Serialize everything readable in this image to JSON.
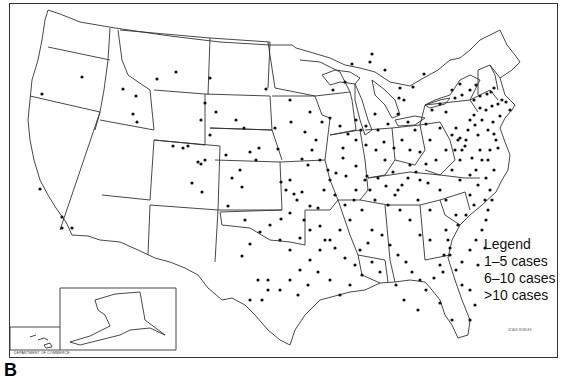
{
  "figure": {
    "panel_label": "B",
    "colors": {
      "background": "#ffffff",
      "lines": "#333333",
      "dots": "#111111"
    }
  },
  "legend": {
    "title": "Legend",
    "items": [
      {
        "label": "1–5 cases"
      },
      {
        "label": "6–10 cases"
      },
      {
        "label": ">10 cases"
      }
    ]
  },
  "insets": [
    {
      "name": "Alaska",
      "position": "bottom-left"
    },
    {
      "name": "Hawaii",
      "position": "bottom-left"
    }
  ],
  "footer": {
    "credit": "DEPARTMENT OF COMMERCE",
    "scale_label": "SCALE IN MILES"
  },
  "dots": [
    [
      42,
      94
    ],
    [
      82,
      77
    ],
    [
      136,
      96
    ],
    [
      157,
      79
    ],
    [
      176,
      72
    ],
    [
      123,
      89
    ],
    [
      133,
      114
    ],
    [
      137,
      122
    ],
    [
      173,
      146
    ],
    [
      183,
      148
    ],
    [
      188,
      146
    ],
    [
      198,
      162
    ],
    [
      201,
      164
    ],
    [
      205,
      160
    ],
    [
      205,
      103
    ],
    [
      201,
      120
    ],
    [
      266,
      89
    ],
    [
      302,
      159
    ],
    [
      242,
      187
    ],
    [
      202,
      192
    ],
    [
      192,
      183
    ],
    [
      228,
      206
    ],
    [
      245,
      220
    ],
    [
      40,
      189
    ],
    [
      62,
      217
    ],
    [
      72,
      228
    ],
    [
      62,
      228
    ],
    [
      275,
      128
    ],
    [
      281,
      182
    ],
    [
      291,
      122
    ],
    [
      305,
      132
    ],
    [
      308,
      165
    ],
    [
      278,
      149
    ],
    [
      259,
      148
    ],
    [
      286,
      190
    ],
    [
      294,
      194
    ],
    [
      290,
      213
    ],
    [
      281,
      219
    ],
    [
      297,
      200
    ],
    [
      290,
      180
    ],
    [
      302,
      192
    ],
    [
      310,
      206
    ],
    [
      318,
      208
    ],
    [
      304,
      220
    ],
    [
      336,
      173
    ],
    [
      343,
      148
    ],
    [
      343,
      158
    ],
    [
      346,
      176
    ],
    [
      356,
      166
    ],
    [
      354,
      200
    ],
    [
      367,
      176
    ],
    [
      370,
      190
    ],
    [
      385,
      160
    ],
    [
      393,
      172
    ],
    [
      398,
      190
    ],
    [
      410,
      165
    ],
    [
      420,
      180
    ],
    [
      418,
      200
    ],
    [
      428,
      183
    ],
    [
      430,
      210
    ],
    [
      440,
      190
    ],
    [
      446,
      200
    ],
    [
      446,
      230
    ],
    [
      456,
      215
    ],
    [
      460,
      180
    ],
    [
      452,
      170
    ],
    [
      460,
      160
    ],
    [
      462,
      150
    ],
    [
      466,
      140
    ],
    [
      468,
      130
    ],
    [
      470,
      120
    ],
    [
      474,
      115
    ],
    [
      475,
      125
    ],
    [
      478,
      135
    ],
    [
      480,
      150
    ],
    [
      482,
      160
    ],
    [
      470,
      195
    ],
    [
      474,
      205
    ],
    [
      466,
      215
    ],
    [
      458,
      225
    ],
    [
      448,
      240
    ],
    [
      430,
      240
    ],
    [
      420,
      235
    ],
    [
      410,
      220
    ],
    [
      400,
      210
    ],
    [
      388,
      205
    ],
    [
      375,
      200
    ],
    [
      362,
      210
    ],
    [
      350,
      220
    ],
    [
      340,
      230
    ],
    [
      330,
      240
    ],
    [
      320,
      250
    ],
    [
      310,
      260
    ],
    [
      300,
      270
    ],
    [
      290,
      280
    ],
    [
      280,
      290
    ],
    [
      268,
      290
    ],
    [
      258,
      280
    ],
    [
      250,
      300
    ],
    [
      262,
      300
    ],
    [
      268,
      280
    ],
    [
      242,
      256
    ],
    [
      250,
      244
    ],
    [
      260,
      232
    ],
    [
      270,
      225
    ],
    [
      280,
      240
    ],
    [
      290,
      250
    ],
    [
      300,
      238
    ],
    [
      310,
      230
    ],
    [
      320,
      226
    ],
    [
      325,
      240
    ],
    [
      335,
      248
    ],
    [
      345,
      258
    ],
    [
      355,
      265
    ],
    [
      360,
      250
    ],
    [
      368,
      243
    ],
    [
      372,
      230
    ],
    [
      382,
      235
    ],
    [
      390,
      245
    ],
    [
      398,
      255
    ],
    [
      406,
      262
    ],
    [
      412,
      272
    ],
    [
      420,
      280
    ],
    [
      426,
      290
    ],
    [
      434,
      278
    ],
    [
      440,
      265
    ],
    [
      444,
      255
    ],
    [
      450,
      248
    ],
    [
      462,
      262
    ],
    [
      470,
      250
    ],
    [
      476,
      240
    ],
    [
      482,
      230
    ],
    [
      486,
      220
    ],
    [
      488,
      210
    ],
    [
      485,
      200
    ],
    [
      478,
      185
    ],
    [
      470,
      175
    ],
    [
      455,
      150
    ],
    [
      458,
      140
    ],
    [
      460,
      138
    ],
    [
      465,
      146
    ],
    [
      472,
      158
    ],
    [
      476,
      170
    ],
    [
      486,
      178
    ],
    [
      490,
      190
    ],
    [
      492,
      200
    ],
    [
      494,
      170
    ],
    [
      488,
      160
    ],
    [
      490,
      150
    ],
    [
      496,
      140
    ],
    [
      488,
      130
    ],
    [
      482,
      120
    ],
    [
      486,
      110
    ],
    [
      492,
      106
    ],
    [
      498,
      104
    ],
    [
      502,
      100
    ],
    [
      506,
      102
    ],
    [
      510,
      110
    ],
    [
      500,
      116
    ],
    [
      493,
      122
    ],
    [
      494,
      134
    ],
    [
      498,
      148
    ],
    [
      480,
      108
    ],
    [
      474,
      100
    ],
    [
      470,
      90
    ],
    [
      456,
      128
    ],
    [
      440,
      128
    ],
    [
      430,
      140
    ],
    [
      420,
      152
    ],
    [
      410,
      150
    ],
    [
      402,
      140
    ],
    [
      394,
      148
    ],
    [
      384,
      142
    ],
    [
      376,
      150
    ],
    [
      366,
      145
    ],
    [
      356,
      140
    ],
    [
      348,
      134
    ],
    [
      340,
      126
    ],
    [
      330,
      118
    ],
    [
      322,
      122
    ],
    [
      316,
      140
    ],
    [
      312,
      150
    ],
    [
      320,
      160
    ],
    [
      328,
      170
    ],
    [
      330,
      180
    ],
    [
      324,
      190
    ],
    [
      335,
      195
    ],
    [
      345,
      205
    ],
    [
      356,
      190
    ],
    [
      365,
      180
    ],
    [
      378,
      178
    ],
    [
      386,
      186
    ],
    [
      395,
      195
    ],
    [
      402,
      185
    ],
    [
      408,
      178
    ],
    [
      416,
      172
    ],
    [
      426,
      164
    ],
    [
      436,
      160
    ],
    [
      446,
      150
    ],
    [
      452,
      135
    ],
    [
      446,
      112
    ],
    [
      440,
      104
    ],
    [
      432,
      110
    ],
    [
      426,
      124
    ],
    [
      415,
      130
    ],
    [
      408,
      122
    ],
    [
      398,
      114
    ],
    [
      388,
      124
    ],
    [
      378,
      130
    ],
    [
      366,
      126
    ],
    [
      356,
      120
    ],
    [
      450,
      255
    ],
    [
      443,
      272
    ],
    [
      404,
      300
    ],
    [
      418,
      310
    ],
    [
      440,
      303
    ],
    [
      452,
      320
    ],
    [
      396,
      285
    ],
    [
      380,
      272
    ],
    [
      372,
      262
    ],
    [
      362,
      275
    ],
    [
      350,
      285
    ],
    [
      340,
      295
    ],
    [
      330,
      280
    ],
    [
      318,
      272
    ],
    [
      308,
      285
    ],
    [
      298,
      295
    ],
    [
      470,
      320
    ],
    [
      475,
      305
    ],
    [
      470,
      290
    ],
    [
      462,
      285
    ],
    [
      456,
      270
    ],
    [
      478,
      265
    ],
    [
      485,
      248
    ],
    [
      455,
      98
    ],
    [
      452,
      90
    ],
    [
      462,
      95
    ],
    [
      476,
      85
    ],
    [
      480,
      96
    ],
    [
      487,
      94
    ],
    [
      491,
      92
    ],
    [
      494,
      88
    ],
    [
      460,
      84
    ],
    [
      424,
      74
    ],
    [
      413,
      87
    ],
    [
      399,
      98
    ],
    [
      375,
      114
    ],
    [
      361,
      130
    ],
    [
      345,
      82
    ],
    [
      333,
      90
    ],
    [
      290,
      100
    ],
    [
      310,
      112
    ],
    [
      250,
      152
    ],
    [
      256,
      160
    ],
    [
      240,
      170
    ],
    [
      232,
      178
    ],
    [
      226,
      155
    ],
    [
      244,
      128
    ],
    [
      236,
      120
    ],
    [
      210,
      78
    ],
    [
      216,
      112
    ],
    [
      210,
      135
    ],
    [
      404,
      100
    ],
    [
      400,
      88
    ],
    [
      385,
      70
    ],
    [
      370,
      62
    ],
    [
      372,
      54
    ],
    [
      352,
      64
    ]
  ]
}
